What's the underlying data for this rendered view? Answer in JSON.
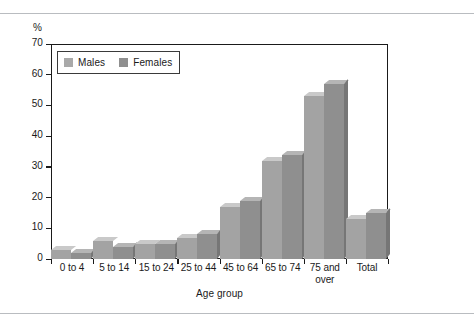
{
  "chart_data": {
    "type": "bar",
    "title": "",
    "subtitle": "",
    "xlabel": "Age group",
    "ylabel": "%",
    "unit_label": "%",
    "ylim": [
      0,
      70
    ],
    "yticks": [
      0,
      10,
      20,
      30,
      40,
      50,
      60,
      70
    ],
    "ytick_labels": [
      "0",
      "10",
      "20",
      "30",
      "40",
      "50",
      "60",
      "70"
    ],
    "grid": false,
    "legend_position": "top-left",
    "categories": [
      "0 to 4",
      "5 to 14",
      "15 to 24",
      "25 to 44",
      "45 to 64",
      "65 to 74",
      "75 and\nover",
      "Total"
    ],
    "series": [
      {
        "name": "Males",
        "color": "#a3a3a3",
        "values": [
          3,
          6,
          5,
          7,
          17,
          32,
          53,
          13
        ]
      },
      {
        "name": "Females",
        "color": "#8f8f8f",
        "values": [
          2,
          4,
          5,
          8,
          19,
          34,
          57,
          15
        ]
      }
    ]
  },
  "legend": {
    "items": [
      {
        "label": "Males",
        "color": "#a3a3a3"
      },
      {
        "label": "Females",
        "color": "#8f8f8f"
      }
    ]
  },
  "axis": {
    "y_unit": "%",
    "x_title": "Age group"
  }
}
